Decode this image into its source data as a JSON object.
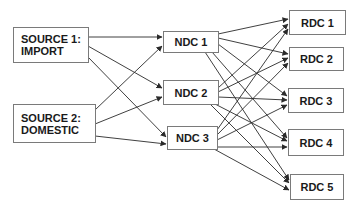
{
  "diagram": {
    "type": "supply-chain-network",
    "sources": [
      {
        "id": "S1",
        "line1": "SOURCE 1:",
        "line2": "IMPORT"
      },
      {
        "id": "S2",
        "line1": "SOURCE 2:",
        "line2": "DOMESTIC"
      }
    ],
    "ndcs": [
      {
        "id": "N1",
        "label": "NDC 1"
      },
      {
        "id": "N2",
        "label": "NDC 2"
      },
      {
        "id": "N3",
        "label": "NDC 3"
      }
    ],
    "rdcs": [
      {
        "id": "R1",
        "label": "RDC 1"
      },
      {
        "id": "R2",
        "label": "RDC 2"
      },
      {
        "id": "R3",
        "label": "RDC 3"
      },
      {
        "id": "R4",
        "label": "RDC 4"
      },
      {
        "id": "R5",
        "label": "RDC 5"
      }
    ],
    "edges": [
      [
        "S1",
        "N1"
      ],
      [
        "S1",
        "N2"
      ],
      [
        "S1",
        "N3"
      ],
      [
        "S2",
        "N1"
      ],
      [
        "S2",
        "N2"
      ],
      [
        "S2",
        "N3"
      ],
      [
        "N1",
        "R1"
      ],
      [
        "N1",
        "R2"
      ],
      [
        "N1",
        "R3"
      ],
      [
        "N1",
        "R4"
      ],
      [
        "N1",
        "R5"
      ],
      [
        "N2",
        "R1"
      ],
      [
        "N2",
        "R2"
      ],
      [
        "N2",
        "R3"
      ],
      [
        "N2",
        "R4"
      ],
      [
        "N2",
        "R5"
      ],
      [
        "N3",
        "R1"
      ],
      [
        "N3",
        "R2"
      ],
      [
        "N3",
        "R3"
      ],
      [
        "N3",
        "R4"
      ],
      [
        "N3",
        "R5"
      ]
    ],
    "colors": {
      "line": "#2a2a2a",
      "border": "#7a7a7a",
      "text": "#1a1a1a"
    }
  }
}
